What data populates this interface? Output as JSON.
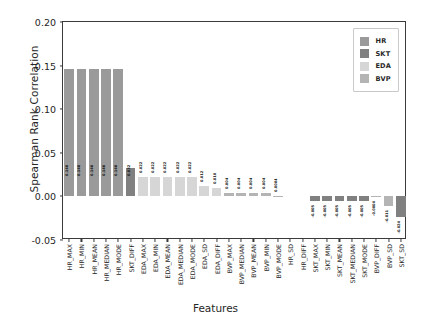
{
  "chart_data": {
    "type": "bar",
    "title": "",
    "xlabel": "Features",
    "ylabel": "Spearman Rank Correlation",
    "ylim": [
      -0.05,
      0.2
    ],
    "yticks": [
      "0.20",
      "0.15",
      "0.10",
      "0.05",
      "0.00",
      "-0.05"
    ],
    "ytick_values": [
      0.2,
      0.15,
      0.1,
      0.05,
      0.0,
      -0.05
    ],
    "grid": false,
    "legend_position": "upper right",
    "legend": [
      {
        "label": "HR",
        "color": "#9a9a9a"
      },
      {
        "label": "SKT",
        "color": "#808080"
      },
      {
        "label": "EDA",
        "color": "#d6d6d6"
      },
      {
        "label": "BVP",
        "color": "#b4b4b4"
      }
    ],
    "categories": [
      "HR_MAX",
      "HR_MIN",
      "HR_MEAN",
      "HR_MEDIAN",
      "HR_MODE",
      "SKT_DIFF",
      "EDA_MAX",
      "EDA_MIN",
      "EDA_MEAN",
      "EDA_MEDIAN",
      "EDA_MODE",
      "EDA_SD",
      "EDA_DIFF",
      "BVP_MAX",
      "BVP_MEDIAN",
      "BVP_MEAN",
      "BVP_MIN",
      "BVP_MODE",
      "HR_SD",
      "HR_DIFF",
      "SKT_MAX",
      "SKT_MIN",
      "SKT_MEAN",
      "SKT_MEDIAN",
      "SKT_MODE",
      "BVP_DIFF",
      "BVP_SD",
      "SKT_SD"
    ],
    "values": [
      0.146,
      0.146,
      0.146,
      0.146,
      0.146,
      0.032,
      0.022,
      0.022,
      0.022,
      0.022,
      0.022,
      0.012,
      0.01,
      0.004,
      0.004,
      0.004,
      0.004,
      0.0004,
      0.0,
      0.0,
      -0.005,
      -0.005,
      -0.005,
      -0.005,
      -0.005,
      -0.0004,
      -0.011,
      -0.024
    ],
    "bar_labels": [
      "0.146",
      "0.146",
      "0.146",
      "0.146",
      "0.146",
      "0.032",
      "0.022",
      "0.022",
      "0.022",
      "0.022",
      "0.022",
      "0.012",
      "0.010",
      "0.004",
      "0.004",
      "0.004",
      "0.004",
      "0.0004",
      "",
      "",
      "-0.005",
      "-0.005",
      "-0.005",
      "-0.005",
      "-0.005",
      "-0.0004",
      "-0.011",
      "-0.024"
    ],
    "groups": [
      "HR",
      "HR",
      "HR",
      "HR",
      "HR",
      "SKT",
      "EDA",
      "EDA",
      "EDA",
      "EDA",
      "EDA",
      "EDA",
      "EDA",
      "BVP",
      "BVP",
      "BVP",
      "BVP",
      "BVP",
      "HR",
      "HR",
      "SKT",
      "SKT",
      "SKT",
      "SKT",
      "SKT",
      "BVP",
      "BVP",
      "SKT"
    ]
  }
}
